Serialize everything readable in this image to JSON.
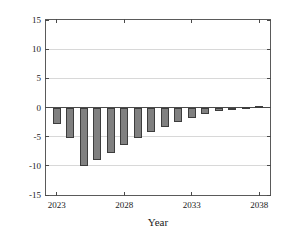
{
  "chart_data": {
    "type": "bar",
    "title": "",
    "xlabel": "Year",
    "ylabel": "Cash Flow, Million $",
    "xlim": [
      2022.2,
      2038.8
    ],
    "ylim": [
      -15,
      15
    ],
    "grid": true,
    "legend": null,
    "yticks": [
      15,
      10,
      5,
      0,
      -5,
      -10,
      -15
    ],
    "ytick_labels": [
      "15",
      "10",
      "5",
      "0",
      "-5",
      "-10",
      "-15"
    ],
    "xticks": [
      2023,
      2028,
      2033,
      2038
    ],
    "xtick_labels": [
      "2023",
      "2028",
      "2033",
      "2038"
    ],
    "categories": [
      2023,
      2024,
      2025,
      2026,
      2027,
      2028,
      2029,
      2030,
      2031,
      2032,
      2033,
      2034,
      2035,
      2036,
      2037,
      2038
    ],
    "values": [
      -2.8,
      -5.3,
      -10.0,
      -9.0,
      -7.8,
      -6.4,
      -5.2,
      -4.2,
      -3.4,
      -2.5,
      -1.8,
      -1.1,
      -0.6,
      -0.2,
      0.1,
      0.3
    ],
    "bar_color": "#808080",
    "bar_edge_color": "#3d3d3d",
    "axis_color": "#4a4a4a",
    "grid_color": "#d8d8d8",
    "background_color": "#ffffff"
  },
  "figure": {
    "name": "cash-flow-bar-chart"
  }
}
